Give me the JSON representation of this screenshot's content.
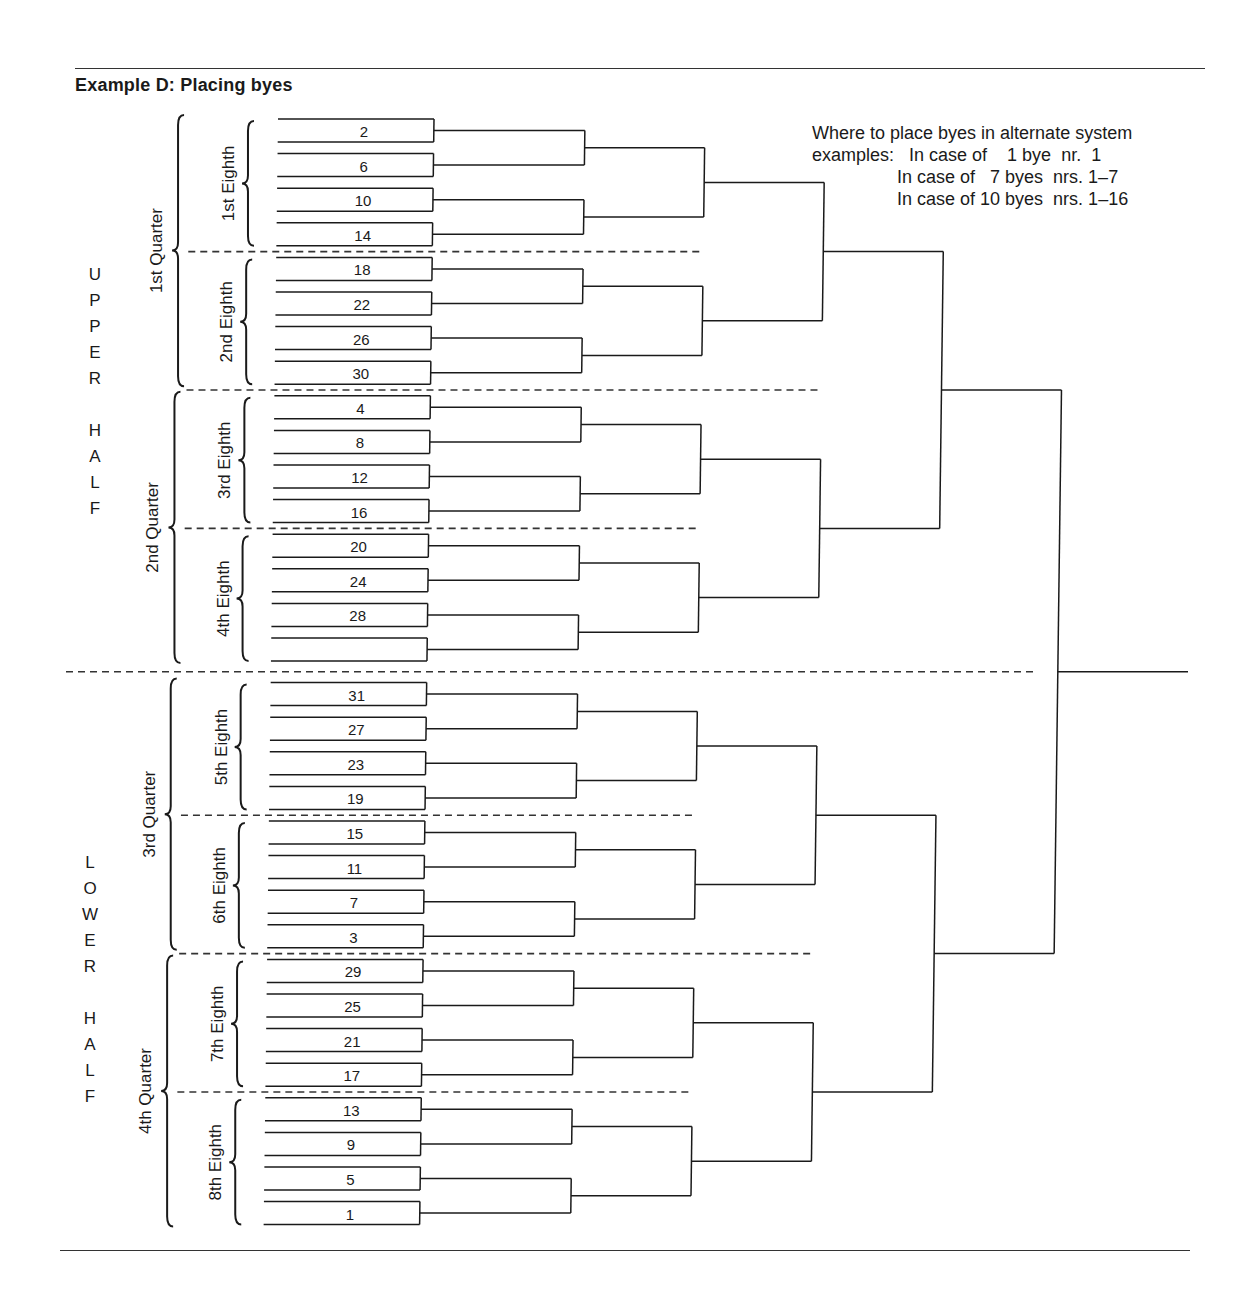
{
  "title": "Example D:  Placing byes",
  "note": {
    "lines": [
      "Where to place byes in alternate system",
      "examples:   In case of    1 bye  nr.  1",
      "                 In case of   7 byes  nrs. 1–7",
      "                 In case of 10 byes  nrs. 1–16"
    ]
  },
  "halves": [
    {
      "label": "UPPER HALF",
      "letters": [
        "U",
        "P",
        "P",
        "E",
        "R",
        "",
        "H",
        "A",
        "L",
        "F"
      ]
    },
    {
      "label": "LOWER HALF",
      "letters": [
        "L",
        "O",
        "W",
        "E",
        "R",
        "",
        "H",
        "A",
        "L",
        "F"
      ]
    }
  ],
  "quarters": [
    "1st Quarter",
    "2nd Quarter",
    "3rd Quarter",
    "4th Quarter"
  ],
  "eighths": [
    "1st Eighth",
    "2nd Eighth",
    "3rd Eighth",
    "4th Eighth",
    "5th Eighth",
    "6th Eighth",
    "7th Eighth",
    "8th Eighth"
  ],
  "first_round_boxes": [
    "2",
    "6",
    "10",
    "14",
    "18",
    "22",
    "26",
    "30",
    "4",
    "8",
    "12",
    "16",
    "20",
    "24",
    "28",
    "",
    "31",
    "27",
    "23",
    "19",
    "15",
    "11",
    "7",
    "3",
    "29",
    "25",
    "21",
    "17",
    "13",
    "9",
    "5",
    "1"
  ],
  "colors": {
    "line": "#1a1a1a",
    "dash": "#333333"
  }
}
